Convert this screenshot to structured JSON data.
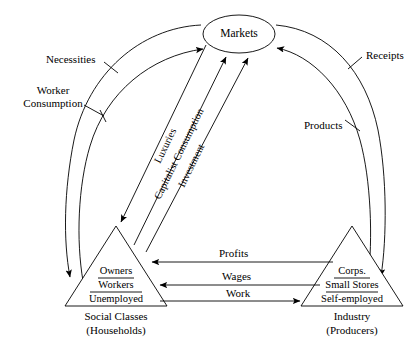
{
  "diagram": {
    "type": "circular-flow-economic-diagram",
    "hub": {
      "label": "Markets",
      "shape": "ellipse"
    },
    "actors": [
      {
        "id": "social-classes",
        "caption_line1": "Social Classes",
        "caption_line2": "(Households)",
        "shape": "triangle",
        "tiers": [
          {
            "rank": 1,
            "label": "Owners"
          },
          {
            "rank": 2,
            "label": "Workers"
          },
          {
            "rank": 3,
            "label": "Unemployed"
          }
        ]
      },
      {
        "id": "industry",
        "caption_line1": "Industry",
        "caption_line2": "(Producers)",
        "shape": "triangle",
        "tiers": [
          {
            "rank": 1,
            "label": "Corps."
          },
          {
            "rank": 2,
            "label": "Small Stores"
          },
          {
            "rank": 3,
            "label": "Self-employed"
          }
        ]
      }
    ],
    "arc_flows": [
      {
        "id": "necessities",
        "label": "Necessities",
        "side": "left",
        "ring": "outer",
        "from": "markets",
        "to": "social-classes"
      },
      {
        "id": "worker-consumption",
        "label_line1": "Worker",
        "label_line2": "Consumption",
        "side": "left",
        "ring": "inner",
        "from": "social-classes",
        "to": "markets"
      },
      {
        "id": "receipts",
        "label": "Receipts",
        "side": "right",
        "ring": "outer",
        "from": "markets",
        "to": "industry"
      },
      {
        "id": "products",
        "label": "Products",
        "side": "right",
        "ring": "inner",
        "from": "industry",
        "to": "markets"
      }
    ],
    "diagonal_flows": [
      {
        "id": "luxuries",
        "label": "Luxuries",
        "from": "markets",
        "to": "owners"
      },
      {
        "id": "capitalist-consumption",
        "label": "Capitalist Consumption",
        "from": "owners",
        "to": "markets"
      },
      {
        "id": "investment",
        "label": "Investment",
        "from": "owners",
        "to": "markets"
      }
    ],
    "horizontal_flows": [
      {
        "id": "profits",
        "label": "Profits",
        "direction": "right-to-left",
        "from": "industry",
        "to": "social-classes"
      },
      {
        "id": "wages",
        "label": "Wages",
        "direction": "right-to-left",
        "from": "industry",
        "to": "social-classes"
      },
      {
        "id": "work",
        "label": "Work",
        "direction": "left-to-right",
        "from": "social-classes",
        "to": "industry"
      }
    ],
    "colors": {
      "stroke": "#000000",
      "background": "#ffffff",
      "text": "#000000"
    }
  }
}
